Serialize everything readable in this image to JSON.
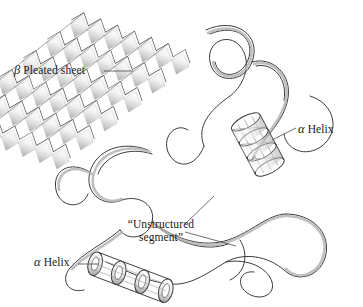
{
  "figure": {
    "type": "protein-ribbon-diagram",
    "background_color": "#ffffff",
    "ink_color": "#3a3a3a",
    "shade_color": "#b9b9b9",
    "leader_color": "#4a4a4a"
  },
  "labels": {
    "beta_sheet": {
      "greek": "β",
      "text": " Pleated sheet",
      "full": "β Pleated sheet"
    },
    "alpha_helix_right": {
      "greek": "α",
      "text": " Helix",
      "full": "α Helix"
    },
    "alpha_helix_left": {
      "greek": "α",
      "text": " Helix",
      "full": "α Helix"
    },
    "unstructured": {
      "line1": "“Unstructured",
      "line2": "segment”",
      "full": "“Unstructured segment”"
    }
  },
  "structures": {
    "beta_sheet": {
      "name": "beta-pleated-sheet",
      "strand_count": 6,
      "tilt_degrees": 20
    },
    "alpha_helix_right": {
      "name": "alpha-helix-ribbon-coil",
      "turns": 4
    },
    "alpha_helix_left": {
      "name": "alpha-helix-cylinder-coil",
      "turns": 4
    },
    "unstructured_segments": {
      "name": "unstructured-loop-ribbons",
      "count": 2
    }
  }
}
